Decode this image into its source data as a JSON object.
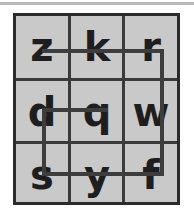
{
  "puzzle": {
    "title": "letter-grid-path-puzzle",
    "rows": 3,
    "cols": 3,
    "cells": [
      [
        {
          "letter": "z",
          "name": "cell-r0c0"
        },
        {
          "letter": "k",
          "name": "cell-r0c1"
        },
        {
          "letter": "r",
          "name": "cell-r0c2"
        }
      ],
      [
        {
          "letter": "d",
          "name": "cell-r1c0"
        },
        {
          "letter": "q",
          "name": "cell-r1c1"
        },
        {
          "letter": "w",
          "name": "cell-r1c2"
        }
      ],
      [
        {
          "letter": "s",
          "name": "cell-r2c0"
        },
        {
          "letter": "y",
          "name": "cell-r2c1"
        },
        {
          "letter": "f",
          "name": "cell-r2c2"
        }
      ]
    ],
    "connectors": [
      {
        "id": "conn-top",
        "orientation": "horizontal",
        "from": "z",
        "to": "r",
        "through": "k"
      },
      {
        "id": "conn-right",
        "orientation": "vertical",
        "from": "r",
        "to": "f",
        "through": "w"
      },
      {
        "id": "conn-middle",
        "orientation": "horizontal",
        "from": "d",
        "to": "q",
        "through": ""
      },
      {
        "id": "conn-left",
        "orientation": "vertical",
        "from": "d",
        "to": "s",
        "through": ""
      },
      {
        "id": "conn-bottom",
        "orientation": "horizontal",
        "from": "s",
        "to": "f",
        "through": "y"
      }
    ]
  },
  "colors": {
    "page_background": "#ffffff",
    "panel_fill": "#c9c9c9",
    "panel_border": "#2b2b2b",
    "grid_line": "#3a3a3a",
    "connector": "#3d3d3d",
    "letter": "#1e1e1e",
    "top_rule": "#b9b9b9"
  }
}
